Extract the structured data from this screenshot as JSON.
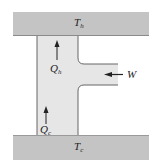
{
  "diagram": {
    "type": "refrigerator-heat-pump-schematic",
    "hot_reservoir": {
      "label_main": "T",
      "label_sub": "h"
    },
    "cold_reservoir": {
      "label_main": "T",
      "label_sub": "c"
    },
    "heat_in": {
      "label_main": "Q",
      "label_sub": "c",
      "direction": "up"
    },
    "heat_out": {
      "label_main": "Q",
      "label_sub": "h",
      "direction": "up"
    },
    "work_in": {
      "label": "W",
      "direction": "left"
    },
    "colors": {
      "reservoir_fill": "#c4c4c4",
      "device_fill": "#e6e6e6",
      "outline": "#555555",
      "arrow": "#222222"
    }
  }
}
